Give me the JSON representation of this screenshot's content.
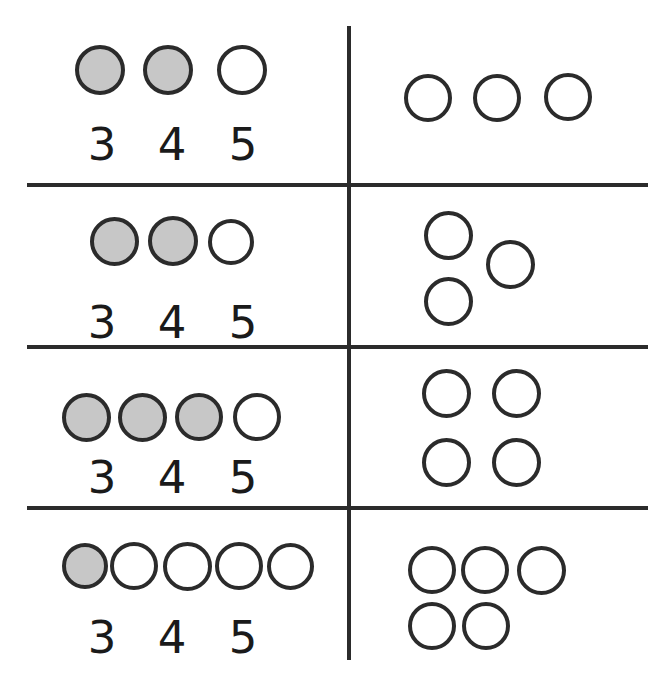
{
  "document": {
    "kind": "counting-worksheet",
    "columns": [
      "answer-choices",
      "objects-to-count"
    ]
  },
  "style": {
    "background": "#ffffff",
    "line_color": "#2b2b2b",
    "stroke_color": "#2b2b2b",
    "circle_stroke_width": 4,
    "shaded_fill": "#c7c7c7",
    "unshaded_fill": "#ffffff",
    "number_color": "#1a1a1a",
    "number_font_size": 45
  },
  "grid": {
    "column_divider": {
      "x": 347,
      "top": 26,
      "bottom": 660,
      "thickness": 4
    },
    "row_dividers": [
      {
        "y": 183,
        "left": 27,
        "right": 648,
        "thickness": 4
      },
      {
        "y": 345,
        "left": 27,
        "right": 648,
        "thickness": 4
      },
      {
        "y": 506,
        "left": 27,
        "right": 648,
        "thickness": 4
      }
    ]
  },
  "rows": [
    {
      "left": {
        "circles": [
          {
            "cx": 100,
            "cy": 70,
            "d": 50,
            "shaded": true
          },
          {
            "cx": 168,
            "cy": 70,
            "d": 50,
            "shaded": true
          },
          {
            "cx": 242,
            "cy": 70,
            "d": 50,
            "shaded": false
          }
        ],
        "numbers": [
          {
            "label": "3",
            "cx": 102,
            "cy": 144
          },
          {
            "label": "4",
            "cx": 172,
            "cy": 144
          },
          {
            "label": "5",
            "cx": 243,
            "cy": 144
          }
        ]
      },
      "right": {
        "count": 3,
        "circles": [
          {
            "cx": 428,
            "cy": 98,
            "d": 48
          },
          {
            "cx": 497,
            "cy": 98,
            "d": 48
          },
          {
            "cx": 568,
            "cy": 97,
            "d": 48
          }
        ]
      }
    },
    {
      "left": {
        "circles": [
          {
            "cx": 114,
            "cy": 241,
            "d": 49,
            "shaded": true
          },
          {
            "cx": 173,
            "cy": 241,
            "d": 50,
            "shaded": true
          },
          {
            "cx": 231,
            "cy": 242,
            "d": 46,
            "shaded": false
          }
        ],
        "numbers": [
          {
            "label": "3",
            "cx": 102,
            "cy": 322
          },
          {
            "label": "4",
            "cx": 172,
            "cy": 322
          },
          {
            "label": "5",
            "cx": 243,
            "cy": 322
          }
        ]
      },
      "right": {
        "count": 3,
        "circles": [
          {
            "cx": 448,
            "cy": 235,
            "d": 49
          },
          {
            "cx": 510,
            "cy": 264,
            "d": 49
          },
          {
            "cx": 448,
            "cy": 301,
            "d": 49
          }
        ]
      }
    },
    {
      "left": {
        "circles": [
          {
            "cx": 86,
            "cy": 417,
            "d": 49,
            "shaded": true
          },
          {
            "cx": 142,
            "cy": 417,
            "d": 49,
            "shaded": true
          },
          {
            "cx": 199,
            "cy": 417,
            "d": 48,
            "shaded": true
          },
          {
            "cx": 257,
            "cy": 417,
            "d": 48,
            "shaded": false
          }
        ],
        "numbers": [
          {
            "label": "3",
            "cx": 102,
            "cy": 477
          },
          {
            "label": "4",
            "cx": 172,
            "cy": 477
          },
          {
            "label": "5",
            "cx": 243,
            "cy": 477
          }
        ]
      },
      "right": {
        "count": 4,
        "circles": [
          {
            "cx": 446,
            "cy": 393,
            "d": 49
          },
          {
            "cx": 516,
            "cy": 393,
            "d": 49
          },
          {
            "cx": 446,
            "cy": 462,
            "d": 49
          },
          {
            "cx": 516,
            "cy": 462,
            "d": 49
          }
        ]
      }
    },
    {
      "left": {
        "circles": [
          {
            "cx": 85,
            "cy": 566,
            "d": 46,
            "shaded": true
          },
          {
            "cx": 134,
            "cy": 566,
            "d": 48,
            "shaded": false
          },
          {
            "cx": 187,
            "cy": 566,
            "d": 49,
            "shaded": false
          },
          {
            "cx": 239,
            "cy": 566,
            "d": 48,
            "shaded": false
          },
          {
            "cx": 290,
            "cy": 566,
            "d": 47,
            "shaded": false
          }
        ],
        "numbers": [
          {
            "label": "3",
            "cx": 102,
            "cy": 637
          },
          {
            "label": "4",
            "cx": 172,
            "cy": 637
          },
          {
            "label": "5",
            "cx": 243,
            "cy": 637
          }
        ]
      },
      "right": {
        "count": 5,
        "circles": [
          {
            "cx": 432,
            "cy": 570,
            "d": 48
          },
          {
            "cx": 485,
            "cy": 570,
            "d": 48
          },
          {
            "cx": 541,
            "cy": 570,
            "d": 49
          },
          {
            "cx": 432,
            "cy": 626,
            "d": 48
          },
          {
            "cx": 486,
            "cy": 626,
            "d": 48
          }
        ]
      }
    }
  ]
}
